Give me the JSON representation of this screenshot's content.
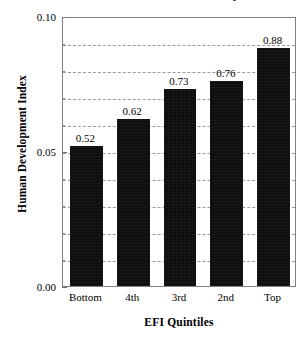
{
  "chart_data": {
    "type": "bar",
    "title": "Economic Freedom and Human Development",
    "xlabel": "EFI Quintiles",
    "ylabel": "Human Development Index",
    "categories": [
      "Bottom",
      "4th",
      "3rd",
      "2nd",
      "Top"
    ],
    "values": [
      0.52,
      0.62,
      0.73,
      0.76,
      0.88
    ],
    "data_labels": [
      "0.52",
      "0.62",
      "0.73",
      "0.76",
      "0.88"
    ],
    "bar_plot_values": [
      0.052,
      0.062,
      0.073,
      0.076,
      0.088
    ],
    "ylim": [
      0.0,
      0.1
    ],
    "ytick_labels": [
      "0.00",
      "0.05",
      "0.10"
    ],
    "ytick_values": [
      0.0,
      0.05,
      0.1
    ],
    "yminor_tick_values": [
      0.01,
      0.02,
      0.03,
      0.04,
      0.06,
      0.07,
      0.08,
      0.09
    ],
    "gridline_values": [
      0.01,
      0.02,
      0.03,
      0.04,
      0.05,
      0.06,
      0.07,
      0.08,
      0.09
    ],
    "grid": "horizontal-dashed",
    "legend": "none",
    "bar_color": "#0d0d0d",
    "grid_color": "#9a9a9a",
    "frame_color": "#808080"
  }
}
